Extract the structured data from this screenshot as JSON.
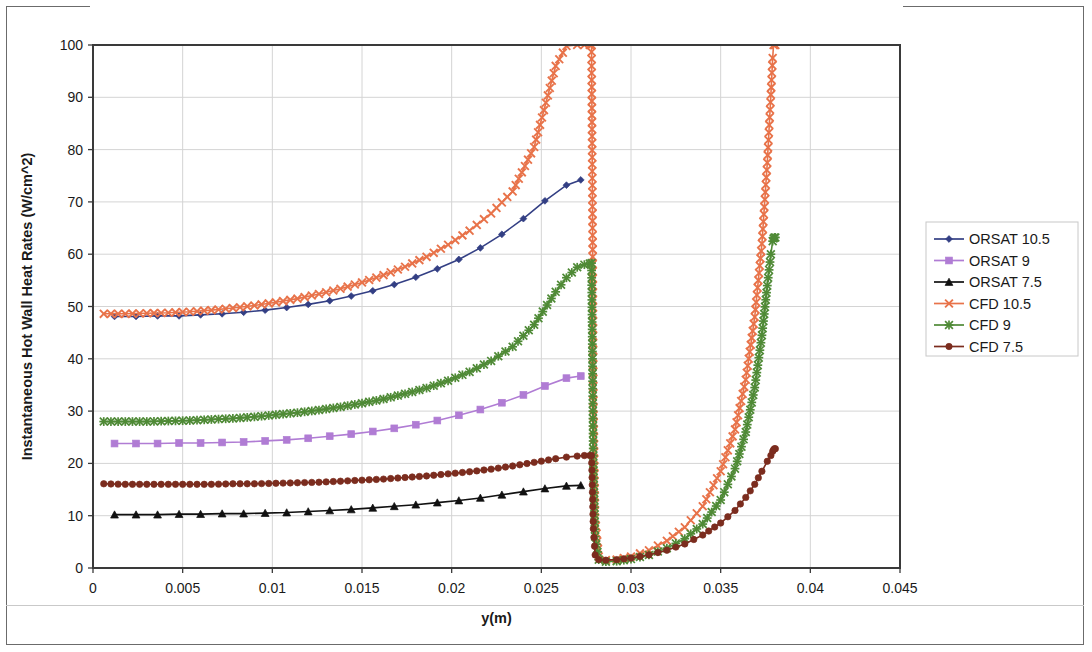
{
  "chart_data": {
    "type": "line",
    "title": "",
    "xlabel": "y(m)",
    "ylabel": "Instantaneous Hot Wall Heat Rates (W/cm^2)",
    "xlim": [
      0,
      0.045
    ],
    "ylim": [
      0,
      100
    ],
    "xticks": [
      "0",
      "0.005",
      "0.01",
      "0.015",
      "0.02",
      "0.025",
      "0.03",
      "0.035",
      "0.04",
      "0.045"
    ],
    "xtick_values": [
      0,
      0.005,
      0.01,
      0.015,
      0.02,
      0.025,
      0.03,
      0.035,
      0.04,
      0.045
    ],
    "yticks": [
      "0",
      "10",
      "20",
      "30",
      "40",
      "50",
      "60",
      "70",
      "80",
      "90",
      "100"
    ],
    "ytick_values": [
      0,
      10,
      20,
      30,
      40,
      50,
      60,
      70,
      80,
      90,
      100
    ],
    "grid": "horizontal-and-vertical",
    "legend_position": "right",
    "series": [
      {
        "name": "ORSAT 10.5",
        "color": "#333f84",
        "marker": "diamond",
        "x": [
          0.0012,
          0.0024,
          0.0036,
          0.0048,
          0.006,
          0.0072,
          0.0084,
          0.0096,
          0.0108,
          0.012,
          0.0132,
          0.0144,
          0.0156,
          0.0168,
          0.018,
          0.0192,
          0.0204,
          0.0216,
          0.0228,
          0.024,
          0.0252,
          0.0264,
          0.0272
        ],
        "values": [
          48.1,
          48.1,
          48.2,
          48.2,
          48.4,
          48.6,
          48.9,
          49.3,
          49.8,
          50.4,
          51.1,
          52.0,
          53.0,
          54.2,
          55.6,
          57.2,
          59.0,
          61.2,
          63.8,
          66.8,
          70.2,
          73.2,
          74.2
        ]
      },
      {
        "name": "ORSAT 9",
        "color": "#b07cd4",
        "marker": "square",
        "x": [
          0.0012,
          0.0024,
          0.0036,
          0.0048,
          0.006,
          0.0072,
          0.0084,
          0.0096,
          0.0108,
          0.012,
          0.0132,
          0.0144,
          0.0156,
          0.0168,
          0.018,
          0.0192,
          0.0204,
          0.0216,
          0.0228,
          0.024,
          0.0252,
          0.0264,
          0.0272
        ],
        "values": [
          23.8,
          23.8,
          23.8,
          23.9,
          23.9,
          24.0,
          24.1,
          24.3,
          24.5,
          24.8,
          25.2,
          25.6,
          26.1,
          26.7,
          27.4,
          28.2,
          29.2,
          30.3,
          31.6,
          33.1,
          34.8,
          36.3,
          36.7
        ]
      },
      {
        "name": "ORSAT 7.5",
        "color": "#111111",
        "marker": "triangle",
        "x": [
          0.0012,
          0.0024,
          0.0036,
          0.0048,
          0.006,
          0.0072,
          0.0084,
          0.0096,
          0.0108,
          0.012,
          0.0132,
          0.0144,
          0.0156,
          0.0168,
          0.018,
          0.0192,
          0.0204,
          0.0216,
          0.0228,
          0.024,
          0.0252,
          0.0264,
          0.0272
        ],
        "values": [
          10.2,
          10.2,
          10.2,
          10.3,
          10.3,
          10.4,
          10.4,
          10.5,
          10.6,
          10.8,
          11.0,
          11.2,
          11.5,
          11.8,
          12.1,
          12.5,
          12.9,
          13.4,
          14.0,
          14.6,
          15.2,
          15.7,
          15.8
        ]
      },
      {
        "name": "CFD 10.5",
        "color": "#e8734a",
        "marker": "x",
        "x": [
          0.0006,
          0.0018,
          0.003,
          0.0042,
          0.0054,
          0.0066,
          0.0078,
          0.009,
          0.0102,
          0.0114,
          0.0126,
          0.0138,
          0.015,
          0.0162,
          0.0174,
          0.0186,
          0.0198,
          0.021,
          0.0222,
          0.0234,
          0.0246,
          0.0258,
          0.0264,
          0.027,
          0.0274,
          0.0277,
          0.0278,
          0.02785,
          0.0279,
          0.028,
          0.0282,
          0.0286,
          0.0292,
          0.03,
          0.031,
          0.032,
          0.033,
          0.034,
          0.035,
          0.0358,
          0.0364,
          0.0369,
          0.0373,
          0.0376,
          0.0378,
          0.0379,
          0.03795,
          0.038,
          0.03805
        ],
        "values": [
          48.6,
          48.6,
          48.7,
          48.8,
          49.0,
          49.3,
          49.7,
          50.2,
          50.8,
          51.5,
          52.4,
          53.4,
          54.6,
          56.0,
          57.6,
          59.5,
          61.8,
          64.5,
          67.8,
          72.0,
          80.5,
          96.0,
          99.8,
          100,
          100,
          100,
          100,
          70.5,
          32.0,
          9.5,
          2.2,
          1.5,
          1.6,
          2.2,
          3.4,
          5.2,
          7.8,
          11.8,
          18.5,
          26.5,
          36.0,
          48.0,
          62.0,
          77.5,
          90.5,
          97.5,
          100,
          100,
          100
        ]
      },
      {
        "name": "CFD 9",
        "color": "#4f8a36",
        "marker": "star",
        "x": [
          0.0006,
          0.0018,
          0.003,
          0.0042,
          0.0054,
          0.0066,
          0.0078,
          0.009,
          0.0102,
          0.0114,
          0.0126,
          0.0138,
          0.015,
          0.0162,
          0.0174,
          0.0186,
          0.0198,
          0.021,
          0.0222,
          0.0234,
          0.0246,
          0.0258,
          0.0264,
          0.027,
          0.0274,
          0.0277,
          0.0278,
          0.02785,
          0.0279,
          0.028,
          0.0282,
          0.0286,
          0.0292,
          0.03,
          0.031,
          0.032,
          0.033,
          0.034,
          0.035,
          0.0358,
          0.0364,
          0.0369,
          0.0373,
          0.0376,
          0.0378,
          0.0379,
          0.03795,
          0.038,
          0.03805
        ],
        "values": [
          28.0,
          28.0,
          28.0,
          28.1,
          28.2,
          28.4,
          28.6,
          28.9,
          29.3,
          29.7,
          30.2,
          30.8,
          31.5,
          32.3,
          33.3,
          34.4,
          35.8,
          37.5,
          39.6,
          42.3,
          46.5,
          52.8,
          55.5,
          57.5,
          58.0,
          58.2,
          58.3,
          40.0,
          20.0,
          6.0,
          1.6,
          1.2,
          1.3,
          1.7,
          2.5,
          3.8,
          5.6,
          8.4,
          13.0,
          19.0,
          26.0,
          34.5,
          44.5,
          54.0,
          60.0,
          62.5,
          63.0,
          63.2,
          63.2
        ]
      },
      {
        "name": "CFD 7.5",
        "color": "#7b2c1e",
        "marker": "circle",
        "x": [
          0.0006,
          0.0018,
          0.003,
          0.0042,
          0.0054,
          0.0066,
          0.0078,
          0.009,
          0.0102,
          0.0114,
          0.0126,
          0.0138,
          0.015,
          0.0162,
          0.0174,
          0.0186,
          0.0198,
          0.021,
          0.0222,
          0.0234,
          0.0246,
          0.0258,
          0.0264,
          0.027,
          0.0274,
          0.0277,
          0.0278,
          0.02785,
          0.0279,
          0.028,
          0.0282,
          0.0286,
          0.0292,
          0.03,
          0.031,
          0.032,
          0.033,
          0.034,
          0.035,
          0.0358,
          0.0364,
          0.0369,
          0.0373,
          0.0376,
          0.0378,
          0.0379,
          0.03795,
          0.038,
          0.03805
        ],
        "values": [
          16.1,
          16.0,
          16.0,
          16.0,
          16.0,
          16.0,
          16.1,
          16.1,
          16.2,
          16.3,
          16.4,
          16.6,
          16.8,
          17.0,
          17.3,
          17.6,
          18.0,
          18.4,
          18.9,
          19.5,
          20.2,
          20.9,
          21.2,
          21.4,
          21.5,
          21.5,
          21.5,
          14.5,
          7.5,
          2.5,
          1.6,
          1.5,
          1.6,
          1.9,
          2.5,
          3.4,
          4.6,
          6.3,
          8.6,
          11.0,
          13.5,
          16.0,
          18.5,
          20.4,
          21.5,
          22.3,
          22.6,
          22.8,
          22.8
        ]
      }
    ]
  },
  "legend": {
    "entries": [
      {
        "label": "ORSAT 10.5",
        "color": "#333f84",
        "marker": "diamond"
      },
      {
        "label": "ORSAT 9",
        "color": "#b07cd4",
        "marker": "square"
      },
      {
        "label": "ORSAT 7.5",
        "color": "#111111",
        "marker": "triangle"
      },
      {
        "label": "CFD 10.5",
        "color": "#e8734a",
        "marker": "x"
      },
      {
        "label": "CFD 9",
        "color": "#4f8a36",
        "marker": "star"
      },
      {
        "label": "CFD 7.5",
        "color": "#7b2c1e",
        "marker": "circle"
      }
    ]
  }
}
